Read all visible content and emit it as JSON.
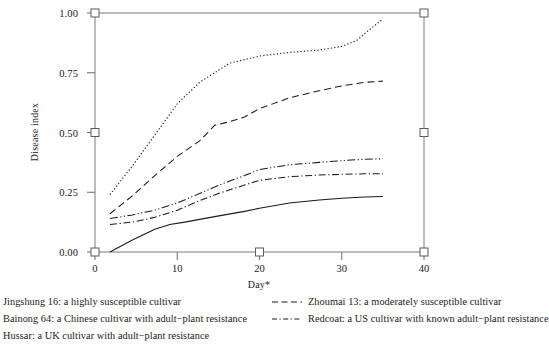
{
  "chart_data": {
    "type": "line",
    "title": "",
    "xlabel": "Day*",
    "ylabel": "Disease index",
    "xlim": [
      -2,
      42
    ],
    "ylim": [
      0.0,
      1.0
    ],
    "xticks": [
      0,
      10,
      20,
      30,
      40
    ],
    "xtick_labels": [
      "0",
      "10",
      "20",
      "30",
      "40"
    ],
    "yticks": [
      0.0,
      0.25,
      0.5,
      0.75,
      1.0
    ],
    "ytick_labels": [
      "0.00",
      "0.25",
      "0.50",
      "0.75",
      "1.00"
    ],
    "grid": false,
    "legend_position": "below-axes",
    "series": [
      {
        "name": "Jingshung 16: a highly susceptible cultivar",
        "style": "dotted",
        "x": [
          0,
          3,
          6,
          9,
          12,
          13,
          16,
          20,
          24,
          28,
          31,
          33,
          34.5,
          36.5
        ],
        "values": [
          0.24,
          0.36,
          0.49,
          0.62,
          0.71,
          0.73,
          0.79,
          0.82,
          0.835,
          0.845,
          0.86,
          0.885,
          0.925,
          0.975
        ]
      },
      {
        "name": "Zhoumai 13: a moderately susceptible cultivar",
        "style": "dashed",
        "x": [
          0,
          3,
          6,
          9,
          12,
          14,
          16,
          18,
          20,
          24,
          28,
          31,
          34,
          36.5
        ],
        "values": [
          0.16,
          0.235,
          0.32,
          0.4,
          0.465,
          0.53,
          0.545,
          0.565,
          0.6,
          0.645,
          0.675,
          0.695,
          0.71,
          0.715
        ]
      },
      {
        "name": "Bainong 64: a Chinese cultivar with adult-plant resistance",
        "style": "dash-dot-dot",
        "x": [
          0,
          3,
          6,
          9,
          12,
          15,
          18,
          20,
          24,
          28,
          31,
          34,
          36.5
        ],
        "values": [
          0.14,
          0.155,
          0.175,
          0.205,
          0.245,
          0.285,
          0.32,
          0.345,
          0.365,
          0.375,
          0.382,
          0.388,
          0.39
        ]
      },
      {
        "name": "Redcoat: a US cultivar with known adult-plant resistance",
        "style": "dash-dot",
        "x": [
          0,
          3,
          6,
          9,
          12,
          15,
          18,
          20,
          24,
          28,
          31,
          34,
          36.5
        ],
        "values": [
          0.115,
          0.125,
          0.145,
          0.175,
          0.215,
          0.25,
          0.28,
          0.3,
          0.315,
          0.322,
          0.325,
          0.327,
          0.328
        ]
      },
      {
        "name": "Hussar: a UK cultivar with adult-plant resistance",
        "style": "solid",
        "x": [
          0,
          3,
          6,
          8,
          10,
          14,
          18,
          20,
          24,
          28,
          31,
          34,
          36.5
        ],
        "values": [
          0.0,
          0.05,
          0.095,
          0.115,
          0.125,
          0.148,
          0.17,
          0.183,
          0.205,
          0.218,
          0.225,
          0.23,
          0.232
        ]
      }
    ],
    "axis_markers": {
      "description": "open square markers on left and right spines",
      "left_values": [
        0.0,
        0.5,
        1.0
      ],
      "right_values": [
        0.0,
        0.5,
        1.0
      ]
    }
  },
  "axes": {
    "ylabel": "Disease index",
    "xlabel": "Day*",
    "ytick_labels": [
      "1.00",
      "0.75",
      "0.50",
      "0.25",
      "0.00"
    ],
    "xtick_labels": [
      "0",
      "10",
      "20",
      "30",
      "40"
    ]
  },
  "legend": {
    "left_column": [
      {
        "label": "Jingshung 16: a highly susceptible cultivar",
        "style": "dotted",
        "show_swatch": false
      },
      {
        "label": "Bainong 64: a Chinese cultivar with adult−plant resistance",
        "style": "dash-dot-dot",
        "show_swatch": false
      },
      {
        "label": "Hussar: a UK cultivar with adult−plant resistance",
        "style": "solid",
        "show_swatch": false
      }
    ],
    "right_column": [
      {
        "label": "Zhoumai 13: a moderately susceptible cultivar",
        "style": "dashed",
        "show_swatch": true
      },
      {
        "label": "Redcoat: a US cultivar with known adult−plant resistance",
        "style": "dash-dot",
        "show_swatch": true
      }
    ]
  },
  "colors": {
    "line": "#1a1a1a",
    "axis": "#6b6b6b",
    "text": "#161616",
    "background": "#ffffff"
  }
}
